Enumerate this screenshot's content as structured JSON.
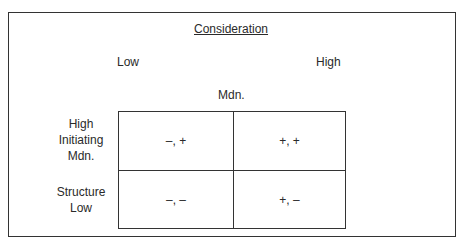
{
  "diagram": {
    "title": "Consideration",
    "column_labels": {
      "low": "Low",
      "high": "High",
      "median": "Mdn."
    },
    "row_labels": {
      "top": [
        "High",
        "Initiating",
        "Mdn."
      ],
      "bottom": [
        "Structure",
        "Low"
      ]
    },
    "cells": {
      "top_left": "–, +",
      "top_right": "+, +",
      "bottom_left": "–, –",
      "bottom_right": "+, –"
    }
  }
}
